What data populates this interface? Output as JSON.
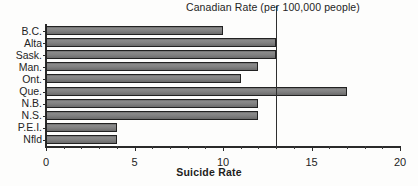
{
  "chart_data": {
    "type": "bar",
    "orientation": "horizontal",
    "title": "",
    "xlabel": "Suicide Rate",
    "ylabel": "",
    "categories": [
      "B.C.",
      "Alta",
      "Sask.",
      "Man.",
      "Ont.",
      "Que.",
      "N.B.",
      "N.S.",
      "P.E.I.",
      "Nfld"
    ],
    "values": [
      10,
      13,
      13,
      12,
      11,
      17,
      12,
      12,
      4,
      4
    ],
    "xlim": [
      0,
      20
    ],
    "ylim": null,
    "grid": false,
    "legend": null,
    "xticks": [
      0,
      5,
      10,
      15,
      20
    ],
    "xticklabels": [
      "0",
      "5",
      "10",
      "15",
      "20"
    ],
    "minor_tick_step": 1,
    "annotations": [
      {
        "label": "Canadian Rate (per 100,000 people)",
        "type": "vertical-reference-line",
        "value": 13
      }
    ],
    "bar_color": "#7d7d7d",
    "bar_edge_color": "#222222",
    "axis_color": "#2a2a2a"
  },
  "axis": {
    "x_title": "Suicide Rate",
    "tick_labels": [
      "0",
      "5",
      "10",
      "15",
      "20"
    ],
    "category_labels": [
      "B.C.",
      "Alta",
      "Sask.",
      "Man.",
      "Ont.",
      "Que.",
      "N.B.",
      "N.S.",
      "P.E.I.",
      "Nfld"
    ]
  },
  "annotation": {
    "reference_title": "Canadian Rate (per 100,000 people)"
  }
}
